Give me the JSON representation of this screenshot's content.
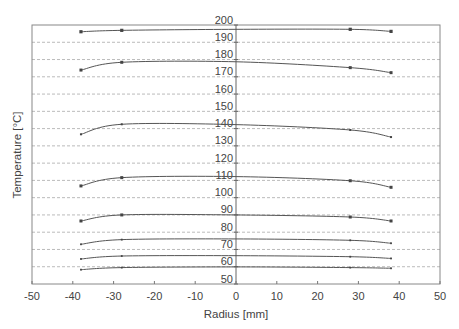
{
  "chart_data": {
    "type": "line",
    "title": "",
    "xlabel": "Radius [mm]",
    "ylabel": "Temperature [°C]",
    "xlim": [
      -50,
      50
    ],
    "ylim": [
      50,
      200
    ],
    "xticks": [
      -50,
      -40,
      -30,
      -20,
      -10,
      0,
      10,
      20,
      30,
      40,
      50
    ],
    "yticks": [
      50,
      60,
      70,
      80,
      90,
      100,
      110,
      120,
      130,
      140,
      150,
      160,
      170,
      180,
      190,
      200
    ],
    "grid": {
      "horizontal": true,
      "style": "dashed",
      "color": "#bbbbbb"
    },
    "legend": null,
    "x": [
      -38,
      -28,
      0,
      28,
      38
    ],
    "series": [
      {
        "name": "profile-1",
        "values": [
          196.1,
          196.9,
          197.5,
          197.5,
          196.3
        ],
        "marker": "square",
        "marker_size": 3.2
      },
      {
        "name": "profile-2",
        "values": [
          173.9,
          178.4,
          178.7,
          175.3,
          172.4
        ],
        "marker": "square",
        "marker_size": 3
      },
      {
        "name": "profile-3",
        "values": [
          136.7,
          142.5,
          142.3,
          139.2,
          135.1
        ],
        "marker": "square",
        "marker_size": 2
      },
      {
        "name": "profile-4",
        "values": [
          106.8,
          111.6,
          112.2,
          109.8,
          106.0
        ],
        "marker": "square",
        "marker_size": 3
      },
      {
        "name": "profile-5",
        "values": [
          86.5,
          90.0,
          90.0,
          88.8,
          86.5
        ],
        "marker": "square",
        "marker_size": 3
      },
      {
        "name": "profile-6",
        "values": [
          73.0,
          75.7,
          76.1,
          75.3,
          73.6
        ],
        "marker": "square",
        "marker_size": 1.8
      },
      {
        "name": "profile-7",
        "values": [
          64.5,
          66.2,
          66.4,
          65.8,
          64.8
        ],
        "marker": "square",
        "marker_size": 1.8
      },
      {
        "name": "profile-8",
        "values": [
          58.3,
          59.5,
          59.9,
          59.5,
          59.1
        ],
        "marker": "square",
        "marker_size": 1.8
      }
    ],
    "marker_at_x": [
      -38,
      -28,
      28,
      38
    ],
    "colors": {
      "line": "#555555",
      "axis": "#777777",
      "border": "#888888",
      "text": "#444444"
    }
  }
}
